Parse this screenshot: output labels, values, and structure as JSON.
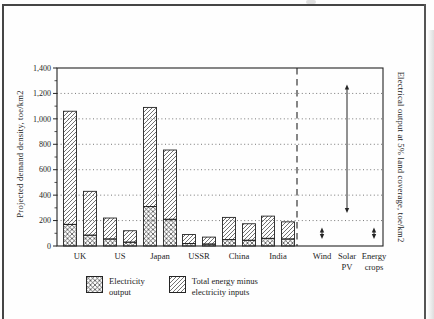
{
  "page": {
    "background": "#fefefe",
    "frame_color": "#454545",
    "ink_color": "#242424"
  },
  "chart_data": {
    "type": "bar",
    "title": "",
    "ylabel": "Projected demand density, toe/km2",
    "right_label": "Electrical output at 5% land coverage, toe/km2",
    "ylim": [
      0,
      1400
    ],
    "ytick_interval": 200,
    "yticks": [
      "0",
      "200",
      "400",
      "600",
      "800",
      "1,000",
      "1,200",
      "1,400"
    ],
    "grid": "dotted horizontal lines at 200-1,200, legend bottom-center, dashed vertical separator before renewables",
    "units": "toe/km2",
    "categories": [
      "UK",
      "US",
      "Japan",
      "USSR",
      "China",
      "India"
    ],
    "countries": [
      {
        "label": "UK",
        "bars": [
          {
            "electricity_output": 170,
            "total": 1060
          },
          {
            "electricity_output": 85,
            "total": 430
          }
        ]
      },
      {
        "label": "US",
        "bars": [
          {
            "electricity_output": 55,
            "total": 220
          },
          {
            "electricity_output": 30,
            "total": 120
          }
        ]
      },
      {
        "label": "Japan",
        "bars": [
          {
            "electricity_output": 310,
            "total": 1090
          },
          {
            "electricity_output": 210,
            "total": 755
          }
        ]
      },
      {
        "label": "USSR",
        "bars": [
          {
            "electricity_output": 20,
            "total": 90
          },
          {
            "electricity_output": 15,
            "total": 70
          }
        ]
      },
      {
        "label": "China",
        "bars": [
          {
            "electricity_output": 50,
            "total": 225
          },
          {
            "electricity_output": 45,
            "total": 175
          }
        ]
      },
      {
        "label": "India",
        "bars": [
          {
            "electricity_output": 60,
            "total": 235
          },
          {
            "electricity_output": 55,
            "total": 190
          }
        ]
      }
    ],
    "renewables": [
      {
        "label": "Wind",
        "label_lines": [
          "Wind"
        ],
        "range": [
          55,
          145
        ]
      },
      {
        "label": "Solar PV",
        "label_lines": [
          "Solar",
          "PV"
        ],
        "range": [
          260,
          1270
        ]
      },
      {
        "label": "Energy crops",
        "label_lines": [
          "Energy",
          "crops"
        ],
        "range": [
          55,
          145
        ]
      }
    ],
    "legend": [
      {
        "lines": [
          "Electricity",
          "output"
        ],
        "hatch": "cross"
      },
      {
        "lines": [
          "Total energy minus",
          "electricity inputs"
        ],
        "hatch": "diagonal"
      }
    ]
  }
}
